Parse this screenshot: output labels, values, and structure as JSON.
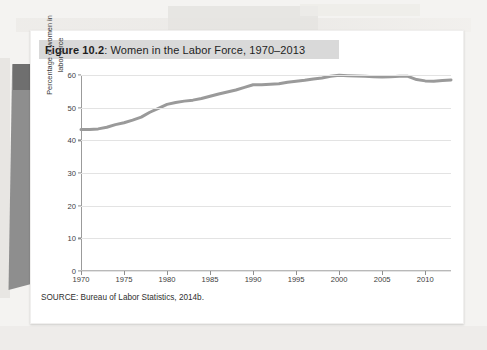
{
  "figure": {
    "number_label": "Figure 10.2",
    "separator": ": ",
    "title": "Women in the Labor Force, 1970–2013",
    "full_title": "Figure 10.2: Women in the Labor Force, 1970–2013",
    "source": "SOURCE: Bureau of Labor Statistics, 2014b."
  },
  "colors": {
    "line": "#9a9a9a",
    "title_band": "#d9d9d9",
    "gridline": "#e3e3e3",
    "axis": "#9b9b9b",
    "card": "#ffffff",
    "page": "#f4f3f1",
    "page_tab": "#8e8e8e"
  },
  "chart_data": {
    "type": "line",
    "title": "Women in the Labor Force, 1970–2013",
    "xlabel": "",
    "ylabel": "Percentage of women in labor force",
    "ylabel_lines": [
      "Percentage of women in",
      "labor force"
    ],
    "xlim": [
      1970,
      2013
    ],
    "ylim": [
      0,
      60
    ],
    "yticks": [
      0,
      10,
      20,
      30,
      40,
      50,
      60
    ],
    "ytick_labels": [
      "0",
      "10",
      "20",
      "30",
      "40",
      "50",
      "60"
    ],
    "xticks": [
      1970,
      1975,
      1980,
      1985,
      1990,
      1995,
      2000,
      2005,
      2010
    ],
    "xtick_labels": [
      "1970",
      "1975",
      "1980",
      "1985",
      "1990",
      "1995",
      "2000",
      "2005",
      "2010"
    ],
    "grid": true,
    "legend": false,
    "series": [
      {
        "name": "Percentage of women in labor force",
        "x": [
          1970,
          1971,
          1972,
          1973,
          1974,
          1975,
          1976,
          1977,
          1978,
          1979,
          1980,
          1981,
          1982,
          1983,
          1984,
          1985,
          1986,
          1987,
          1988,
          1989,
          1990,
          1991,
          1992,
          1993,
          1994,
          1995,
          1996,
          1997,
          1998,
          1999,
          2000,
          2001,
          2002,
          2003,
          2004,
          2005,
          2006,
          2007,
          2008,
          2009,
          2010,
          2011,
          2012,
          2013
        ],
        "values": [
          43.3,
          43.3,
          43.5,
          44.0,
          44.8,
          45.4,
          46.2,
          47.1,
          48.6,
          49.8,
          51.0,
          51.6,
          52.0,
          52.3,
          52.8,
          53.5,
          54.2,
          54.8,
          55.4,
          56.2,
          57.0,
          57.0,
          57.2,
          57.3,
          57.8,
          58.1,
          58.4,
          58.8,
          59.1,
          59.6,
          59.9,
          59.8,
          59.7,
          59.6,
          59.5,
          59.4,
          59.5,
          59.6,
          59.6,
          58.6,
          58.2,
          58.1,
          58.3,
          58.5
        ]
      }
    ]
  }
}
